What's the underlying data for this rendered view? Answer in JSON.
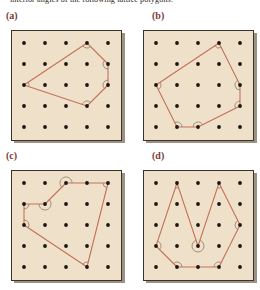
{
  "prompt": {
    "text": "interior angles of the following lattice polygons."
  },
  "colors": {
    "panel_background": "#efe0c9",
    "panel_border": "#3a332c",
    "lattice_dot": "#1a1512",
    "polygon_stroke": "#c4725c",
    "label_text": "#7a3b38",
    "prompt_text": "#2a2522",
    "page_background": "#ffffff",
    "arc_stroke": "#8a7a68"
  },
  "figure": {
    "caption_label": "lattice polygons figure",
    "grid": {
      "cols": 5,
      "rows": 5,
      "description": "5 by 5 square lattice of dots"
    },
    "panels": [
      {
        "id": "a",
        "label": "(a)",
        "polygon_name": "pentagon",
        "vertices": [
          [
            3,
            0
          ],
          [
            4,
            1
          ],
          [
            4,
            2
          ],
          [
            3,
            3
          ],
          [
            0,
            2
          ]
        ],
        "angle_marks": [
          {
            "at": [
              3,
              0
            ],
            "reflex": false
          },
          {
            "at": [
              4,
              1
            ],
            "reflex": false
          },
          {
            "at": [
              4,
              2
            ],
            "reflex": false
          },
          {
            "at": [
              3,
              3
            ],
            "reflex": false
          },
          {
            "at": [
              0,
              2
            ],
            "reflex": false
          }
        ]
      },
      {
        "id": "b",
        "label": "(b)",
        "polygon_name": "hexagon",
        "vertices": [
          [
            3,
            0
          ],
          [
            4,
            2
          ],
          [
            4,
            3
          ],
          [
            2,
            4
          ],
          [
            1,
            4
          ],
          [
            0,
            2
          ]
        ],
        "angle_marks": [
          {
            "at": [
              3,
              0
            ],
            "reflex": false
          },
          {
            "at": [
              4,
              2
            ],
            "reflex": false
          },
          {
            "at": [
              4,
              3
            ],
            "reflex": false
          },
          {
            "at": [
              2,
              4
            ],
            "reflex": false
          },
          {
            "at": [
              1,
              4
            ],
            "reflex": false
          },
          {
            "at": [
              0,
              2
            ],
            "reflex": false
          }
        ]
      },
      {
        "id": "c",
        "label": "(c)",
        "polygon_name": "hexagon with reflex angle",
        "vertices": [
          [
            0,
            1
          ],
          [
            1,
            1
          ],
          [
            2,
            0
          ],
          [
            4,
            0
          ],
          [
            3,
            4
          ],
          [
            0,
            2
          ]
        ],
        "angle_marks": [
          {
            "at": [
              0,
              1
            ],
            "reflex": false
          },
          {
            "at": [
              1,
              1
            ],
            "reflex": true
          },
          {
            "at": [
              2,
              0
            ],
            "reflex": true
          },
          {
            "at": [
              4,
              0
            ],
            "reflex": false
          },
          {
            "at": [
              3,
              4
            ],
            "reflex": false
          },
          {
            "at": [
              0,
              2
            ],
            "reflex": false
          }
        ]
      },
      {
        "id": "d",
        "label": "(d)",
        "polygon_name": "heptagon with reflex angle",
        "vertices": [
          [
            1,
            0
          ],
          [
            2,
            3
          ],
          [
            3,
            0
          ],
          [
            4,
            2
          ],
          [
            3,
            4
          ],
          [
            1,
            4
          ],
          [
            0,
            3
          ]
        ],
        "angle_marks": [
          {
            "at": [
              1,
              0
            ],
            "reflex": false
          },
          {
            "at": [
              2,
              3
            ],
            "reflex": true
          },
          {
            "at": [
              3,
              0
            ],
            "reflex": false
          },
          {
            "at": [
              4,
              2
            ],
            "reflex": false
          },
          {
            "at": [
              3,
              4
            ],
            "reflex": false
          },
          {
            "at": [
              1,
              4
            ],
            "reflex": false
          },
          {
            "at": [
              0,
              3
            ],
            "reflex": false
          }
        ]
      }
    ]
  }
}
